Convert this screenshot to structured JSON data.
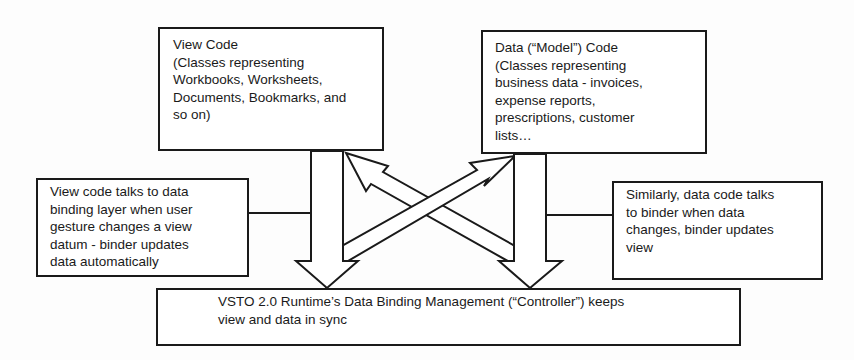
{
  "diagram": {
    "type": "architecture",
    "nodes": {
      "view_code": {
        "lines": [
          "View Code",
          "(Classes representing",
          "Workbooks, Worksheets,",
          "Documents, Bookmarks, and",
          "so on)"
        ]
      },
      "data_code": {
        "lines": [
          "Data (“Model”) Code",
          "(Classes representing",
          "business data - invoices,",
          "expense reports,",
          "prescriptions, customer",
          "lists…"
        ]
      },
      "left_note": {
        "lines": [
          "View code talks to data",
          "binding layer when user",
          "gesture changes a view",
          "datum - binder updates",
          "data automatically"
        ]
      },
      "right_note": {
        "lines": [
          "Similarly, data code talks",
          "to binder when data",
          "changes, binder updates",
          "view"
        ]
      },
      "controller": {
        "lines": [
          "VSTO 2.0 Runtime’s Data Binding Management (“Controller”) keeps",
          "view and data in sync"
        ]
      }
    },
    "edges": [
      {
        "from": "view_code",
        "to": "controller",
        "style": "block-arrow-down"
      },
      {
        "from": "data_code",
        "to": "controller",
        "style": "block-arrow-down"
      },
      {
        "from": "controller",
        "to": "view_code",
        "style": "block-arrow-diagonal"
      },
      {
        "from": "controller",
        "to": "data_code",
        "style": "block-arrow-diagonal"
      },
      {
        "from": "left_note",
        "to": "view_code_arrow",
        "style": "connector-line"
      },
      {
        "from": "right_note",
        "to": "data_code_arrow",
        "style": "connector-line"
      }
    ],
    "colors": {
      "stroke": "#1a1a1a",
      "fill": "#ffffff",
      "background": "#fdfdfd"
    }
  }
}
